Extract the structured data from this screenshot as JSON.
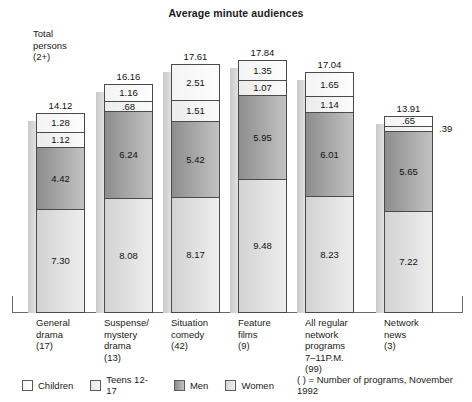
{
  "chart_data": {
    "type": "bar",
    "subtype": "stacked-column",
    "title": "Average minute audiences",
    "xlabel": "",
    "ylabel": "",
    "ylim": [
      0,
      17.84
    ],
    "grid": false,
    "legend_position": "bottom",
    "annotation_total": "Total\npersons\n(2+)",
    "legend_note": "( ) = Number of programs, November 1992",
    "series_order_bottom_to_top": [
      "Women",
      "Men",
      "Teens 12-17",
      "Children"
    ],
    "categories": [
      "General\ndrama\n(17)",
      "Suspense/\nmystery\ndrama\n(13)",
      "Situation\ncomedy\n(42)",
      "Feature\nfilms\n(9)",
      "All regular\nnetwork\nprograms\n7–11P.M.\n(99)",
      "Network\nnews\n(3)"
    ],
    "category_names": [
      "General drama",
      "Suspense/mystery drama",
      "Situation comedy",
      "Feature films",
      "All regular network programs 7-11P.M.",
      "Network news"
    ],
    "program_counts": [
      17,
      13,
      42,
      9,
      99,
      3
    ],
    "series": [
      {
        "name": "Women",
        "values": [
          7.3,
          8.08,
          8.17,
          9.48,
          8.23,
          7.22
        ]
      },
      {
        "name": "Men",
        "values": [
          4.42,
          6.24,
          5.42,
          5.95,
          6.01,
          5.65
        ]
      },
      {
        "name": "Teens 12-17",
        "values": [
          1.12,
          0.68,
          1.51,
          1.07,
          1.14,
          0.39
        ]
      },
      {
        "name": "Children",
        "values": [
          1.28,
          1.16,
          2.51,
          1.35,
          1.65,
          0.65
        ]
      }
    ],
    "totals": [
      14.12,
      16.16,
      17.61,
      17.84,
      17.04,
      13.91
    ]
  },
  "bars": [
    {
      "total": "14.12",
      "segments": [
        {
          "label": "1.28",
          "value": 1.28,
          "cls": "children",
          "series": "Children"
        },
        {
          "label": "1.12",
          "value": 1.12,
          "cls": "teens",
          "series": "Teens 12-17"
        },
        {
          "label": "4.42",
          "value": 4.42,
          "cls": "men",
          "series": "Men"
        },
        {
          "label": "7.30",
          "value": 7.3,
          "cls": "women",
          "series": "Women"
        }
      ]
    },
    {
      "total": "16.16",
      "segments": [
        {
          "label": "1.16",
          "value": 1.16,
          "cls": "children",
          "series": "Children"
        },
        {
          "label": ".68",
          "value": 0.68,
          "cls": "teens",
          "series": "Teens 12-17"
        },
        {
          "label": "6.24",
          "value": 6.24,
          "cls": "men",
          "series": "Men"
        },
        {
          "label": "8.08",
          "value": 8.08,
          "cls": "women",
          "series": "Women"
        }
      ]
    },
    {
      "total": "17.61",
      "segments": [
        {
          "label": "2.51",
          "value": 2.51,
          "cls": "children",
          "series": "Children"
        },
        {
          "label": "1.51",
          "value": 1.51,
          "cls": "teens",
          "series": "Teens 12-17"
        },
        {
          "label": "5.42",
          "value": 5.42,
          "cls": "men",
          "series": "Men"
        },
        {
          "label": "8.17",
          "value": 8.17,
          "cls": "women",
          "series": "Women"
        }
      ]
    },
    {
      "total": "17.84",
      "segments": [
        {
          "label": "1.35",
          "value": 1.35,
          "cls": "children",
          "series": "Children"
        },
        {
          "label": "1.07",
          "value": 1.07,
          "cls": "teens",
          "series": "Teens 12-17"
        },
        {
          "label": "5.95",
          "value": 5.95,
          "cls": "men",
          "series": "Men"
        },
        {
          "label": "9.48",
          "value": 9.48,
          "cls": "women",
          "series": "Women"
        }
      ]
    },
    {
      "total": "17.04",
      "segments": [
        {
          "label": "1.65",
          "value": 1.65,
          "cls": "children",
          "series": "Children"
        },
        {
          "label": "1.14",
          "value": 1.14,
          "cls": "teens",
          "series": "Teens 12-17"
        },
        {
          "label": "6.01",
          "value": 6.01,
          "cls": "men",
          "series": "Men"
        },
        {
          "label": "8.23",
          "value": 8.23,
          "cls": "women",
          "series": "Women"
        }
      ]
    },
    {
      "total": "13.91",
      "segments": [
        {
          "label": ".65",
          "value": 0.65,
          "cls": "children",
          "series": "Children"
        },
        {
          "label": ".39",
          "value": 0.39,
          "cls": "teens",
          "series": "Teens 12-17",
          "outside": true
        },
        {
          "label": "5.65",
          "value": 5.65,
          "cls": "men",
          "series": "Men"
        },
        {
          "label": "7.22",
          "value": 7.22,
          "cls": "women",
          "series": "Women"
        }
      ]
    }
  ],
  "legend": {
    "items": [
      {
        "label": "Children",
        "cls": "children"
      },
      {
        "label": "Teens 12-17",
        "cls": "teens"
      },
      {
        "label": "Men",
        "cls": "men"
      },
      {
        "label": "Women",
        "cls": "women"
      }
    ],
    "note": "( ) = Number of programs, November 1992"
  },
  "colors": {
    "children": "#fafafa",
    "teens": "#f0f0f0",
    "men": "#a6a6a6",
    "women": "#e2e2e2",
    "outline": "#4a4a4a",
    "axis": "#6a6a6a",
    "text": "#1a1a1a",
    "background": "#ffffff"
  }
}
